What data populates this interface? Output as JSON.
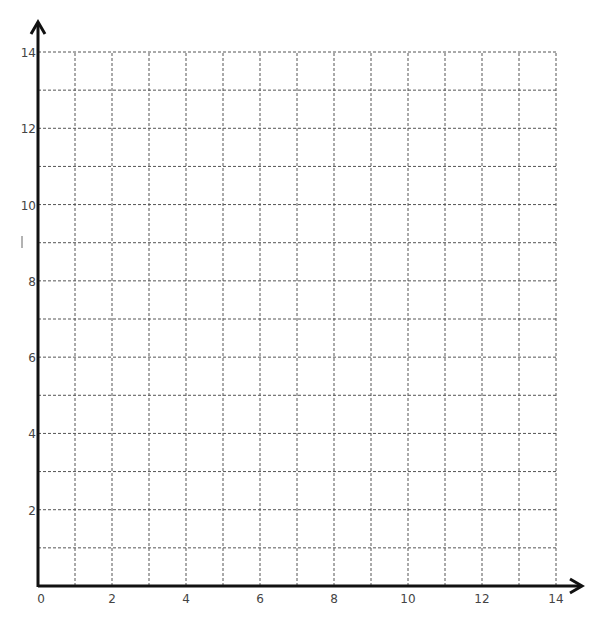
{
  "chart_data": {
    "type": "scatter",
    "title": "",
    "xlabel": "",
    "ylabel": "",
    "xlim": [
      0,
      14
    ],
    "ylim": [
      0,
      14
    ],
    "grid": true,
    "grid_style": "dashed",
    "grid_step": 1,
    "x_ticks": [
      0,
      2,
      4,
      6,
      8,
      10,
      12,
      14
    ],
    "y_ticks": [
      2,
      4,
      6,
      8,
      10,
      12,
      14
    ],
    "series": [],
    "annotations": [
      "blank coordinate grid with arrowed axes"
    ]
  },
  "layout": {
    "origin_px": [
      38,
      586
    ],
    "x_end_px": 556,
    "y_end_px": 52,
    "x_arrow_tip_px": 582,
    "y_arrow_tip_px": 22,
    "axis_color": "#111111",
    "grid_color": "#555555"
  }
}
